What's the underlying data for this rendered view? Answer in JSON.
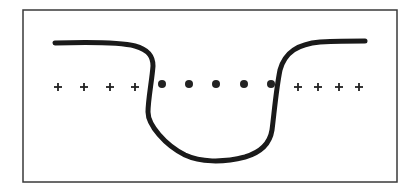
{
  "diagram": {
    "colors": {
      "background": "#ffffff",
      "border": "#3a3a3a",
      "curve": "#1a1a1a",
      "markers": "#222222"
    },
    "border": {
      "x": 23,
      "y": 10,
      "width": 374,
      "height": 172
    },
    "curve_path": "M55,43 C90,42 120,42 135,46 C150,50 153,58 153,66 C152,80 148,100 148,112 C148,125 165,145 185,155 C200,162 222,163 245,157 C262,152 270,143 272,130 C274,115 276,90 280,70 C285,52 298,44 320,42 C340,41 355,41 365,41",
    "plus_signs": {
      "symbol": "+",
      "y": 87,
      "left_x": [
        58,
        84,
        110,
        135
      ],
      "right_x": [
        298,
        318,
        339,
        359
      ]
    },
    "dots": {
      "symbol": "●",
      "y": 84,
      "x": [
        162,
        189,
        216,
        244,
        271
      ],
      "radius": 4
    }
  }
}
